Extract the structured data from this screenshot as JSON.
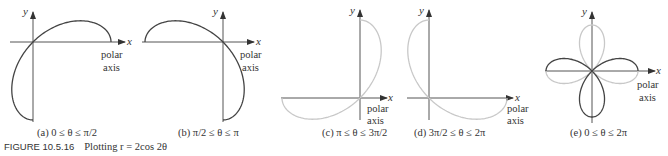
{
  "figure": {
    "number_label": "FIGURE 10.5.16",
    "caption_text": "Plotting r = 2cos 2θ"
  },
  "axes": {
    "x_label": "x",
    "y_label": "y",
    "polar_label_line1": "polar",
    "polar_label_line2": "axis"
  },
  "panels": [
    {
      "id": "a",
      "caption": "(a) 0 ≤ θ ≤ π/2"
    },
    {
      "id": "b",
      "caption": "(b) π/2 ≤ θ ≤ π"
    },
    {
      "id": "c",
      "caption": "(c) π ≤ θ ≤ 3π/2"
    },
    {
      "id": "d",
      "caption": "(d) 3π/2 ≤ θ ≤ 2π"
    },
    {
      "id": "e",
      "caption": "(e) 0 ≤ θ ≤ 2π"
    }
  ],
  "colors": {
    "curve_dark": "#444444",
    "curve_light": "#c8c8c8",
    "axis": "#555555",
    "text": "#333333"
  },
  "chart_data": {
    "type": "line",
    "title": "Plotting r = 2cos 2θ",
    "equation": "r = 2cos(2θ)",
    "coordinate_system": "polar",
    "subplots": [
      {
        "label": "(a)",
        "theta_range": [
          "0",
          "π/2"
        ],
        "highlight": "dark",
        "endpoints_xy": [
          [
            2,
            0
          ],
          [
            0,
            -2
          ]
        ]
      },
      {
        "label": "(b)",
        "theta_range": [
          "π/2",
          "π"
        ],
        "highlight": "dark",
        "endpoints_xy": [
          [
            0,
            -2
          ],
          [
            -2,
            0
          ]
        ]
      },
      {
        "label": "(c)",
        "theta_range": [
          "π",
          "3π/2"
        ],
        "highlight": "light",
        "endpoints_xy": [
          [
            -2,
            0
          ],
          [
            0,
            2
          ]
        ]
      },
      {
        "label": "(d)",
        "theta_range": [
          "3π/2",
          "2π"
        ],
        "highlight": "light",
        "endpoints_xy": [
          [
            0,
            2
          ],
          [
            2,
            0
          ]
        ]
      },
      {
        "label": "(e)",
        "theta_range": [
          "0",
          "2π"
        ],
        "description": "four-leaved rose; petals on x-axis dark (θ 0..π/2 & π..3π/2 sweeps shown dark on horizontal/lower), petals on y-axis partly light"
      }
    ],
    "xlabel": "x",
    "ylabel": "y",
    "r_max": 2
  }
}
